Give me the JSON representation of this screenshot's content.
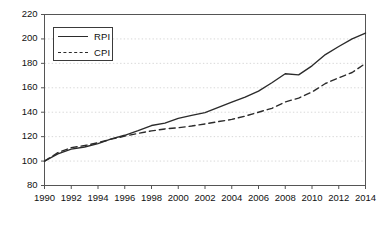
{
  "chart_data": {
    "type": "line",
    "title": "",
    "xlabel": "",
    "ylabel": "",
    "xlim": [
      1990,
      2014
    ],
    "ylim": [
      80,
      220
    ],
    "ytick_step": 20,
    "xtick_step": 2,
    "grid": true,
    "legend_position": "upper-left",
    "yticks": [
      220,
      200,
      180,
      160,
      140,
      120,
      100,
      80
    ],
    "xticks": [
      1990,
      1992,
      1994,
      1996,
      1998,
      2000,
      2002,
      2004,
      2006,
      2008,
      2010,
      2012,
      2014
    ],
    "x": [
      1990,
      1991,
      1992,
      1993,
      1994,
      1995,
      1996,
      1997,
      1998,
      1999,
      2000,
      2001,
      2002,
      2003,
      2004,
      2005,
      2006,
      2007,
      2008,
      2009,
      2010,
      2011,
      2012,
      2013,
      2014
    ],
    "series": [
      {
        "name": "RPI",
        "style": "solid",
        "color": "#2b2b2b",
        "values": [
          100,
          105.9,
          109.8,
          111.5,
          114.3,
          118.2,
          121.1,
          124.9,
          129.1,
          131.1,
          135.0,
          137.4,
          139.7,
          143.9,
          148.2,
          152.4,
          157.3,
          164.1,
          171.5,
          170.6,
          178.0,
          187.2,
          193.8,
          200.1,
          204.8
        ]
      },
      {
        "name": "CPI",
        "style": "dashed",
        "color": "#2b2b2b",
        "values": [
          100,
          106.9,
          111.0,
          112.7,
          115.0,
          118.0,
          120.4,
          122.7,
          124.7,
          126.3,
          127.3,
          128.7,
          130.4,
          132.3,
          134.1,
          136.8,
          140.0,
          143.2,
          148.4,
          151.6,
          156.5,
          163.5,
          168.2,
          172.5,
          180.0
        ]
      }
    ]
  },
  "legend": {
    "items": [
      {
        "label": "RPI",
        "style": "solid"
      },
      {
        "label": "CPI",
        "style": "dashed"
      }
    ]
  },
  "axes": {
    "frame_color": "#555555",
    "grid_color": "#d8d8d8",
    "tick_color": "#555555"
  }
}
